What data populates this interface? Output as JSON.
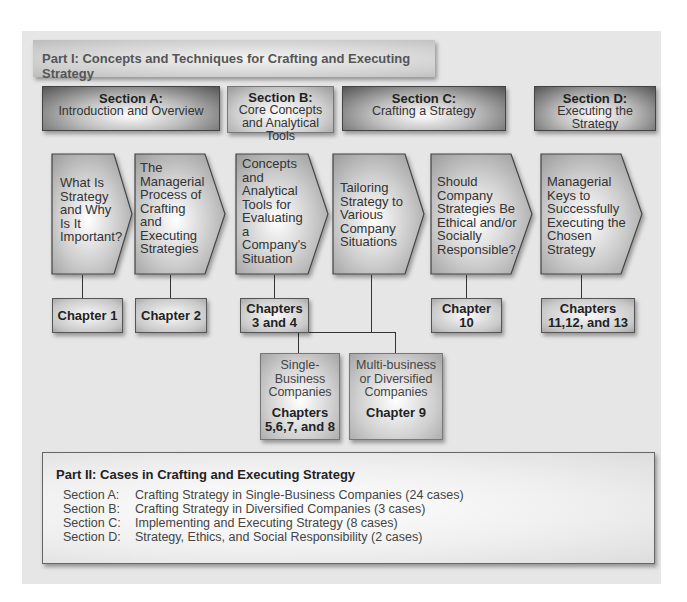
{
  "part1": {
    "title": "Part I: Concepts and Techniques for Crafting and Executing Strategy"
  },
  "sections": [
    {
      "title": "Section A:",
      "subtitle": "Introduction and Overview"
    },
    {
      "title": "Section B:",
      "subtitle": "Core Concepts and Analytical Tools"
    },
    {
      "title": "Section C:",
      "subtitle": "Crafting a Strategy"
    },
    {
      "title": "Section D:",
      "subtitle": "Executing the Strategy"
    }
  ],
  "topics": [
    {
      "lines": [
        "What Is",
        "Strategy",
        "and Why",
        "Is It",
        "Important?"
      ],
      "chapter": [
        "Chapter 1"
      ]
    },
    {
      "lines": [
        "The",
        "Managerial",
        "Process of",
        "Crafting",
        "and",
        "Executing",
        "Strategies"
      ],
      "chapter": [
        "Chapter 2"
      ]
    },
    {
      "lines": [
        "Concepts",
        "and",
        "Analytical",
        "Tools for",
        "Evaluating",
        "a",
        "Company's",
        "Situation"
      ],
      "chapter": [
        "Chapters",
        "3 and 4"
      ]
    },
    {
      "lines": [
        "Tailoring",
        "Strategy to",
        "Various",
        "Company",
        "Situations"
      ],
      "chapter": []
    },
    {
      "lines": [
        "Should",
        "Company",
        "Strategies Be",
        "Ethical and/or",
        "Socially",
        "Responsible?"
      ],
      "chapter": [
        "Chapter",
        "10"
      ]
    },
    {
      "lines": [
        "Managerial",
        "Keys to",
        "Successfully",
        "Executing the",
        "Chosen",
        "Strategy"
      ],
      "chapter": [
        "Chapters",
        "11,12, and 13"
      ]
    }
  ],
  "subtopics": [
    {
      "lines": [
        "Single-",
        "Business",
        "Companies"
      ],
      "chapter": [
        "Chapters",
        "5,6,7, and 8"
      ]
    },
    {
      "lines": [
        "Multi-business",
        "or Diversified",
        "Companies"
      ],
      "chapter": [
        "Chapter 9"
      ]
    }
  ],
  "part2": {
    "title": "Part II: Cases in Crafting and Executing Strategy",
    "rows": [
      {
        "label": "Section A:",
        "text": "Crafting Strategy in Single-Business Companies (24 cases)"
      },
      {
        "label": "Section B:",
        "text": "Crafting Strategy in Diversified Companies (3 cases)"
      },
      {
        "label": "Section C:",
        "text": "Implementing and Executing Strategy (8 cases)"
      },
      {
        "label": "Section D:",
        "text": "Strategy, Ethics, and Social Responsibility (2 cases)"
      }
    ]
  }
}
